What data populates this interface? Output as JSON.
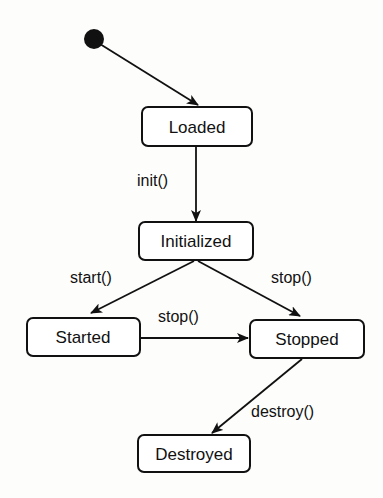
{
  "diagram": {
    "type": "state-machine",
    "initial_state_target": "Loaded",
    "states": [
      {
        "id": "loaded",
        "label": "Loaded"
      },
      {
        "id": "initialized",
        "label": "Initialized"
      },
      {
        "id": "started",
        "label": "Started"
      },
      {
        "id": "stopped",
        "label": "Stopped"
      },
      {
        "id": "destroyed",
        "label": "Destroyed"
      }
    ],
    "transitions": [
      {
        "from": "initial",
        "to": "loaded",
        "label": ""
      },
      {
        "from": "loaded",
        "to": "initialized",
        "label": "init()"
      },
      {
        "from": "initialized",
        "to": "started",
        "label": "start()"
      },
      {
        "from": "initialized",
        "to": "stopped",
        "label": "stop()"
      },
      {
        "from": "started",
        "to": "stopped",
        "label": "stop()"
      },
      {
        "from": "stopped",
        "to": "destroyed",
        "label": "destroy()"
      }
    ],
    "colors": {
      "ink": "#111111",
      "background": "#fdfdfc"
    }
  }
}
